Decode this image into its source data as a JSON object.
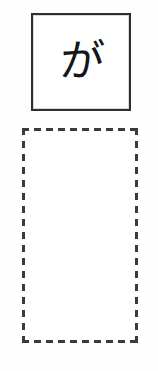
{
  "worksheet": {
    "background_color": "#fefefe",
    "character_cell": {
      "glyph": "が",
      "border_color": "#2e2e32",
      "fill_color": "#ffffff"
    },
    "practice_cell": {
      "content": "",
      "border_color": "#3a3a3e",
      "border_style": "dashed",
      "fill_color": "#ffffff"
    }
  }
}
